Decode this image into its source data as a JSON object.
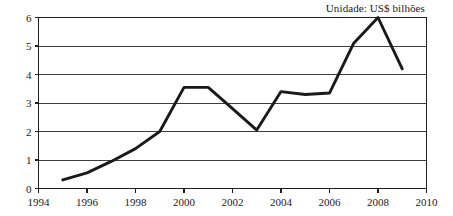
{
  "chart_data": {
    "type": "line",
    "title": "",
    "annotations": [
      "Unidade: US$ bilhões"
    ],
    "unit_note": "Unidade: US$ bilhões",
    "xlabel": "",
    "ylabel": "",
    "xlim": [
      1994,
      2010
    ],
    "ylim": [
      0,
      6
    ],
    "grid": true,
    "legend": false,
    "x_tick_labels": [
      "1994",
      "1996",
      "1998",
      "2000",
      "2002",
      "2004",
      "2006",
      "2008",
      "2010"
    ],
    "x_ticks": [
      1994,
      1996,
      1998,
      2000,
      2002,
      2004,
      2006,
      2008,
      2010
    ],
    "y_tick_labels": [
      "0",
      "1",
      "2",
      "3",
      "4",
      "5",
      "6"
    ],
    "y_ticks": [
      0,
      1,
      2,
      3,
      4,
      5,
      6
    ],
    "x": [
      1995,
      1996,
      1997,
      1998,
      1999,
      2000,
      2001,
      2002,
      2003,
      2004,
      2005,
      2006,
      2007,
      2008,
      2009
    ],
    "series": [
      {
        "name": "valor",
        "color": "#1a1a1a",
        "values": [
          0.3,
          0.55,
          0.95,
          1.4,
          2.0,
          3.55,
          3.55,
          2.8,
          2.05,
          3.4,
          3.3,
          3.35,
          5.1,
          6.0,
          4.2
        ]
      }
    ]
  }
}
